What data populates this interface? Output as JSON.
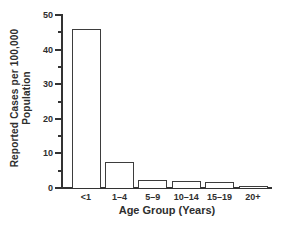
{
  "chart_data": {
    "type": "bar",
    "title": "",
    "categories": [
      "<1",
      "1–4",
      "5–9",
      "10–14",
      "15–19",
      "20+"
    ],
    "values": [
      46,
      7.5,
      2.2,
      1.9,
      1.8,
      0.5
    ],
    "xlabel": "Age Group (Years)",
    "ylabel": "Reported Cases per 100,000 Population",
    "ylabel_line1": "Reported Cases per 100,000",
    "ylabel_line2": "Population",
    "ylim": [
      0,
      50
    ],
    "yticks": [
      0,
      10,
      20,
      30,
      40,
      50
    ],
    "yticks_minor": [
      5,
      15,
      25,
      35,
      45
    ],
    "grid": false,
    "legend": "none",
    "bar_fill": "#ffffff",
    "bar_border": "#3d3d3d",
    "axis_color": "#333333",
    "text_color": "#2e2e2e",
    "background": "#ffffff"
  }
}
